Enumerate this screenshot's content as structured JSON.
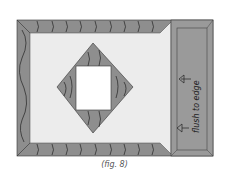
{
  "figure": {
    "caption": "(fig. 8)",
    "annotation": "flush to edge",
    "colors": {
      "background": "#ffffff",
      "frame": "#8e8e8e",
      "panel": "#9a9a9a",
      "field": "#ececec",
      "window": "#ffffff",
      "line": "#222222"
    },
    "elements": [
      {
        "name": "outer-frame",
        "desc": "mitered gray border with wood grain lines"
      },
      {
        "name": "light-field",
        "desc": "light interior panel"
      },
      {
        "name": "diamond",
        "desc": "gray diamond with wood grain"
      },
      {
        "name": "center-window",
        "desc": "white square opening"
      },
      {
        "name": "right-panel",
        "desc": "gray side panel flush to edge"
      },
      {
        "name": "arrows",
        "count": 2,
        "direction": "left"
      }
    ]
  }
}
